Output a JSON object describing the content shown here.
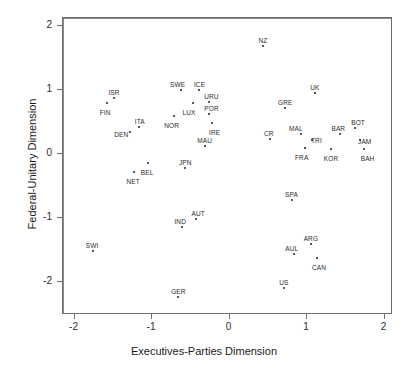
{
  "chart_data": {
    "type": "scatter",
    "title": "",
    "xlabel": "Executives-Parties Dimension",
    "ylabel": "Federal-Unitary Dimension",
    "xlim": [
      -2.35,
      2.1
    ],
    "ylim": [
      -2.45,
      2.2
    ],
    "xticks": [
      "-2",
      "-1",
      "0",
      "1",
      "2"
    ],
    "xtick_values": [
      -2,
      -1,
      0,
      1,
      2
    ],
    "yticks": [
      "2",
      "1",
      "0",
      "-1",
      "-2"
    ],
    "ytick_values": [
      2,
      1,
      0,
      -1,
      -2
    ],
    "grid": false,
    "legend": "none",
    "reference_lines": {
      "x": 0,
      "y": 0
    },
    "points": [
      {
        "label": "NZ",
        "x": 0.43,
        "y": 1.68
      },
      {
        "label": "UK",
        "x": 1.1,
        "y": 0.95
      },
      {
        "label": "SWE",
        "x": -0.63,
        "y": 1.0
      },
      {
        "label": "ICE",
        "x": -0.4,
        "y": 1.0
      },
      {
        "label": "ISR",
        "x": -1.49,
        "y": 0.88
      },
      {
        "label": "FIN",
        "x": -1.58,
        "y": 0.8
      },
      {
        "label": "URU",
        "x": -0.26,
        "y": 0.82
      },
      {
        "label": "LUX",
        "x": -0.47,
        "y": 0.8
      },
      {
        "label": "GRE",
        "x": 0.72,
        "y": 0.72
      },
      {
        "label": "POR",
        "x": -0.27,
        "y": 0.62
      },
      {
        "label": "NOR",
        "x": -0.72,
        "y": 0.6
      },
      {
        "label": "IRE",
        "x": -0.23,
        "y": 0.48
      },
      {
        "label": "ITA",
        "x": -1.17,
        "y": 0.42
      },
      {
        "label": "DEN",
        "x": -1.28,
        "y": 0.34
      },
      {
        "label": "BOT",
        "x": 1.62,
        "y": 0.4
      },
      {
        "label": "MAL",
        "x": 0.92,
        "y": 0.32
      },
      {
        "label": "BAR",
        "x": 1.43,
        "y": 0.32
      },
      {
        "label": "CR",
        "x": 0.52,
        "y": 0.24
      },
      {
        "label": "TRI",
        "x": 1.07,
        "y": 0.22
      },
      {
        "label": "JAM",
        "x": 1.68,
        "y": 0.22
      },
      {
        "label": "MAU",
        "x": -0.32,
        "y": 0.12
      },
      {
        "label": "FRA",
        "x": 0.97,
        "y": 0.1
      },
      {
        "label": "KOR",
        "x": 1.31,
        "y": 0.08
      },
      {
        "label": "BAH",
        "x": 1.73,
        "y": 0.08
      },
      {
        "label": "BEL",
        "x": -1.05,
        "y": -0.14
      },
      {
        "label": "JPN",
        "x": -0.57,
        "y": -0.22
      },
      {
        "label": "NET",
        "x": -1.23,
        "y": -0.28
      },
      {
        "label": "SPA",
        "x": 0.8,
        "y": -0.72
      },
      {
        "label": "AUT",
        "x": -0.43,
        "y": -1.02
      },
      {
        "label": "IND",
        "x": -0.61,
        "y": -1.14
      },
      {
        "label": "ARG",
        "x": 1.05,
        "y": -1.4
      },
      {
        "label": "SWI",
        "x": -1.76,
        "y": -1.52
      },
      {
        "label": "AUL",
        "x": 0.83,
        "y": -1.57
      },
      {
        "label": "CAN",
        "x": 1.13,
        "y": -1.62
      },
      {
        "label": "US",
        "x": 0.7,
        "y": -2.1
      },
      {
        "label": "GER",
        "x": -0.66,
        "y": -2.24
      }
    ]
  },
  "colors": {
    "frame": "#6e6e6e",
    "zero_line": "#8a8a8a",
    "point": "#222222",
    "text": "#2b2b2b",
    "background": "#ffffff"
  }
}
